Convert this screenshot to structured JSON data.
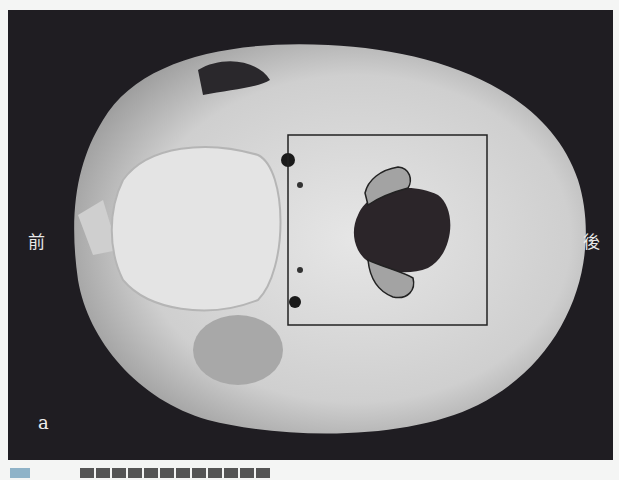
{
  "figure": {
    "panel_letter": "a",
    "orientation_labels": {
      "front": "前",
      "back": "後"
    },
    "caption_truncated": true,
    "colors": {
      "background": "#1f1d22",
      "bone": "#d9d9d9",
      "highlight_fill": "#a3a3a3",
      "box_stroke": "#222222",
      "caption_marker": "#8fb3c8"
    }
  }
}
